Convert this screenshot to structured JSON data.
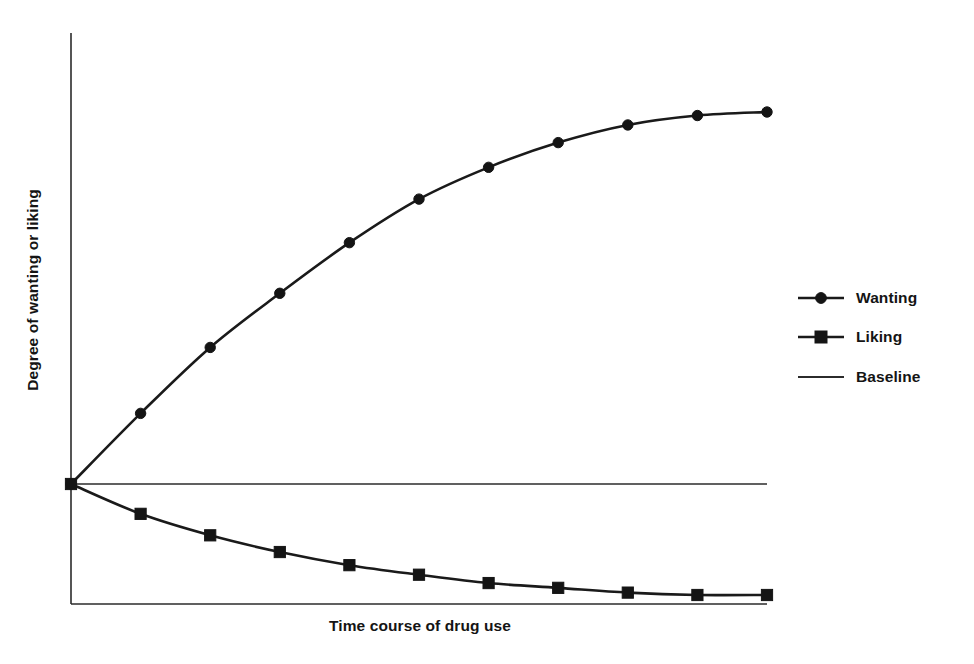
{
  "chart_data": {
    "type": "line",
    "title": "",
    "subtitle": "",
    "xlabel": "Time course of drug use",
    "ylabel": "Degree of wanting or liking",
    "grid": false,
    "legend_position": "right",
    "xlim": [
      0,
      10
    ],
    "ylim": [
      -1,
      1
    ],
    "axis_ticks": {
      "x": [],
      "y": []
    },
    "x": [
      0,
      1,
      2,
      3,
      4,
      5,
      6,
      7,
      8,
      9,
      10
    ],
    "series": [
      {
        "name": "Wanting",
        "marker": "circle",
        "values": [
          0.0,
          0.6,
          1.16,
          1.62,
          2.05,
          2.42,
          2.69,
          2.9,
          3.05,
          3.13,
          3.16
        ]
      },
      {
        "name": "Liking",
        "marker": "square",
        "values": [
          0.0,
          -0.25,
          -0.43,
          -0.57,
          -0.68,
          -0.76,
          -0.83,
          -0.87,
          -0.91,
          -0.93,
          -0.93
        ]
      },
      {
        "name": "Baseline",
        "marker": "none",
        "values": [
          0.0,
          0.0,
          0.0,
          0.0,
          0.0,
          0.0,
          0.0,
          0.0,
          0.0,
          0.0,
          0.0
        ]
      }
    ],
    "annotations": []
  },
  "legend": {
    "entries": [
      {
        "label": "Wanting",
        "marker": "circle-marker"
      },
      {
        "label": "Liking",
        "marker": "square-marker"
      },
      {
        "label": "Baseline",
        "marker": "plain-line"
      }
    ]
  },
  "colors": {
    "background": "#ffffff",
    "ink": "#141414",
    "axis": "#2b2b2b"
  }
}
